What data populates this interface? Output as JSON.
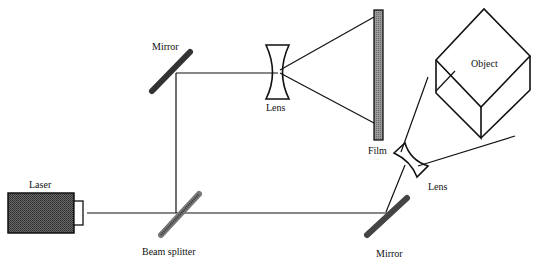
{
  "diagram": {
    "labels": {
      "laser": "Laser",
      "beam_splitter": "Beam splitter",
      "mirror_top": "Mirror",
      "mirror_bottom": "Mirror",
      "lens_top": "Lens",
      "lens_right": "Lens",
      "film": "Film",
      "object": "Object"
    },
    "colors": {
      "line": "#111111",
      "laser_body": "#555555",
      "film": "#8a8a8a",
      "mirror": "#444444",
      "background": "#ffffff"
    },
    "components": [
      {
        "name": "Laser",
        "type": "source"
      },
      {
        "name": "Beam splitter",
        "type": "splitter"
      },
      {
        "name": "Mirror",
        "type": "mirror",
        "position": "top-left"
      },
      {
        "name": "Lens",
        "type": "diverging-lens",
        "position": "reference-beam"
      },
      {
        "name": "Film",
        "type": "recording-plate"
      },
      {
        "name": "Mirror",
        "type": "mirror",
        "position": "bottom-right"
      },
      {
        "name": "Lens",
        "type": "diverging-lens",
        "position": "object-beam"
      },
      {
        "name": "Object",
        "type": "cube"
      }
    ]
  }
}
